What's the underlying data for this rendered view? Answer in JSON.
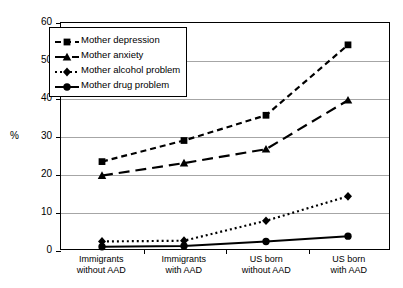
{
  "chart_data": {
    "type": "line",
    "title": "",
    "xlabel": "",
    "ylabel": "%",
    "ylim": [
      0,
      60
    ],
    "ytick_step": 10,
    "yticks": [
      "0",
      "10",
      "20",
      "30",
      "40",
      "50",
      "60"
    ],
    "grid": true,
    "legend_position": "top-left inside plot",
    "categories": [
      "Immigrants\nwithout AAD",
      "Immigrants\nwith AAD",
      "US born\nwithout AAD",
      "US born\nwith AAD"
    ],
    "category_lines": [
      [
        "Immigrants",
        "without AAD"
      ],
      [
        "Immigrants",
        "with AAD"
      ],
      [
        "US born",
        "without AAD"
      ],
      [
        "US born",
        "with AAD"
      ]
    ],
    "series": [
      {
        "name": "Mother depression",
        "marker": "square",
        "dash": "6,4",
        "width": 2.2,
        "color": "#000000",
        "values": [
          23.2,
          28.8,
          35.5,
          54.2
        ]
      },
      {
        "name": "Mother anxiety",
        "marker": "triangle",
        "dash": "11,6",
        "width": 2.2,
        "color": "#000000",
        "values": [
          19.5,
          22.8,
          26.5,
          39.5
        ]
      },
      {
        "name": "Mother alcohol problem",
        "marker": "diamond",
        "dash": "2,3",
        "width": 2.2,
        "color": "#000000",
        "values": [
          2.0,
          2.2,
          7.5,
          14.0
        ]
      },
      {
        "name": "Mother drug problem",
        "marker": "circle",
        "dash": "",
        "width": 2.0,
        "color": "#000000",
        "values": [
          0.6,
          0.8,
          2.0,
          3.4
        ]
      }
    ]
  },
  "legend": {
    "items": [
      {
        "label": "Mother depression"
      },
      {
        "label": "Mother anxiety"
      },
      {
        "label": "Mother alcohol problem"
      },
      {
        "label": "Mother drug problem"
      }
    ]
  },
  "axis": {
    "y_title": "%"
  }
}
